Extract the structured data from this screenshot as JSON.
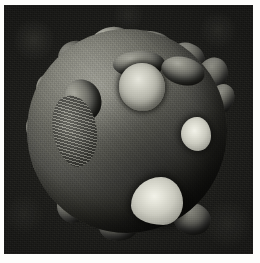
{
  "figure": {
    "domain_label": "Natural-Image",
    "kind": "scanning-electron-micrograph",
    "caption": "",
    "scale_bar_text": "",
    "magnification_text": "",
    "colors": {
      "paper": "#fdfdfb",
      "background_field": "#1a1a17",
      "sphere_midtone": "#67675f",
      "sphere_highlight": "#8e8e86",
      "sphere_shadow": "#2b2b26",
      "bright_patch": "#e6e6dc",
      "brightest_flake": "#f2f2e9"
    },
    "plate": {
      "width_px": 249,
      "height_px": 249,
      "margin_left_px": 4,
      "margin_top_px": 5
    }
  },
  "features": {
    "lobes": [
      {
        "name": "top-left-lobe",
        "left": 35,
        "top": 20,
        "w": 34,
        "h": 30,
        "rot": -18,
        "tone": "dim"
      },
      {
        "name": "top-center-lobe",
        "left": 68,
        "top": 6,
        "w": 42,
        "h": 30,
        "rot": -8,
        "tone": "bright"
      },
      {
        "name": "top-crest-lobe",
        "left": 104,
        "top": 10,
        "w": 46,
        "h": 26,
        "rot": 8,
        "tone": "normal"
      },
      {
        "name": "top-right-lobe",
        "left": 146,
        "top": 22,
        "w": 36,
        "h": 30,
        "rot": 20,
        "tone": "dim"
      },
      {
        "name": "right-upper-lobe",
        "left": 174,
        "top": 36,
        "w": 30,
        "h": 36,
        "rot": 28,
        "tone": "dim"
      },
      {
        "name": "right-mid-lobe",
        "left": 184,
        "top": 62,
        "w": 26,
        "h": 34,
        "rot": 34,
        "tone": "dim"
      },
      {
        "name": "left-upper-lobe",
        "left": 14,
        "top": 52,
        "w": 30,
        "h": 36,
        "rot": -30,
        "tone": "normal"
      },
      {
        "name": "left-mid-lobe",
        "left": 4,
        "top": 92,
        "w": 28,
        "h": 34,
        "rot": -36,
        "tone": "dim"
      },
      {
        "name": "left-lower-lobe",
        "left": 10,
        "top": 126,
        "w": 28,
        "h": 32,
        "rot": -28,
        "tone": "dim"
      },
      {
        "name": "bottom-left-lobe",
        "left": 34,
        "top": 168,
        "w": 32,
        "h": 34,
        "rot": -16,
        "tone": "dim"
      },
      {
        "name": "bottom-center-lobe",
        "left": 76,
        "top": 190,
        "w": 40,
        "h": 30,
        "rot": -4,
        "tone": "dim"
      },
      {
        "name": "bottom-right-lobe",
        "left": 150,
        "top": 182,
        "w": 38,
        "h": 32,
        "rot": 16,
        "tone": "dim"
      },
      {
        "name": "inner-left-lobe-a",
        "left": 42,
        "top": 58,
        "w": 36,
        "h": 42,
        "rot": -22,
        "tone": "normal"
      },
      {
        "name": "inner-left-lobe-b",
        "left": 34,
        "top": 96,
        "w": 34,
        "h": 48,
        "rot": -14,
        "tone": "normal"
      },
      {
        "name": "inner-top-lobe",
        "left": 90,
        "top": 30,
        "w": 52,
        "h": 26,
        "rot": -2,
        "tone": "normal"
      },
      {
        "name": "inner-right-lobe",
        "left": 138,
        "top": 36,
        "w": 44,
        "h": 28,
        "rot": 14,
        "tone": "normal"
      }
    ],
    "craters": [
      {
        "name": "main-bright-crater",
        "left": 96,
        "top": 42,
        "w": 46,
        "h": 48,
        "radius": "50% 50% 48% 52% / 48% 52% 50% 50%"
      }
    ],
    "flakes": [
      {
        "name": "right-bright-flake",
        "left": 158,
        "top": 96,
        "w": 30,
        "h": 34,
        "radius": "54% 46% 42% 58% / 50% 56% 44% 50%"
      },
      {
        "name": "bottom-bright-flake",
        "left": 108,
        "top": 156,
        "w": 52,
        "h": 48,
        "radius": "58% 42% 38% 62% / 60% 54% 46% 40%"
      }
    ],
    "rough_patches": [
      {
        "name": "left-granular-scar",
        "left": 30,
        "top": 74,
        "w": 44,
        "h": 72,
        "rot": -12
      }
    ]
  }
}
